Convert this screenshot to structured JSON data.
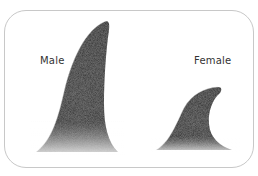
{
  "figure": {
    "labels": {
      "male": "Male",
      "female": "Female"
    },
    "colors": {
      "fin_dark": "#111111",
      "fin_mid": "#3a3a3a",
      "frame_border": "#c8c8c8",
      "background": "#ffffff"
    }
  }
}
